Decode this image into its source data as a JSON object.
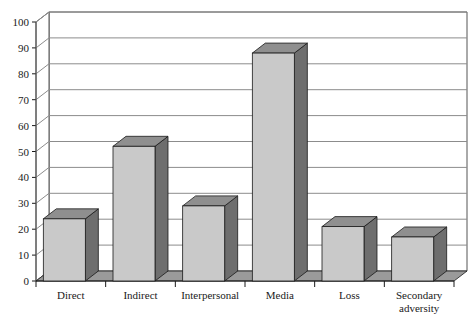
{
  "chart_data": {
    "type": "bar",
    "title": "",
    "subtitle": "",
    "xlabel": "",
    "ylabel": "",
    "categories": [
      "Direct",
      "Indirect",
      "Interpersonal",
      "Media",
      "Loss",
      "Secondary adversity"
    ],
    "values": [
      24,
      52,
      29,
      88,
      21,
      17
    ],
    "series": [
      {
        "name": "Exposure type",
        "values": [
          24,
          52,
          29,
          88,
          21,
          17
        ]
      }
    ],
    "ylim": [
      0,
      100
    ],
    "ytick_labels": [
      "0",
      "10",
      "20",
      "30",
      "40",
      "50",
      "60",
      "70",
      "80",
      "90",
      "100"
    ],
    "ytick_values": [
      0,
      10,
      20,
      30,
      40,
      50,
      60,
      70,
      80,
      90,
      100
    ],
    "grid": true,
    "grid_axis": "y",
    "legend": false,
    "legend_position": "none",
    "style": "3d-column",
    "annotations": []
  },
  "colors": {
    "bar_front": "#c9c9c9",
    "bar_side": "#6e6e6e",
    "bar_top": "#8f8f8f",
    "bar_outline": "#1a1a1a",
    "floor": "#9a9a9a",
    "floor_front": "#767676",
    "plot_background": "#ffffff",
    "grid_line": "#8c8c8c",
    "axis_line": "#555555",
    "text": "#1a1a1a",
    "page_background": "#ffffff"
  },
  "category_labels": [
    {
      "line1": "Direct",
      "line2": ""
    },
    {
      "line1": "Indirect",
      "line2": ""
    },
    {
      "line1": "Interpersonal",
      "line2": ""
    },
    {
      "line1": "Media",
      "line2": ""
    },
    {
      "line1": "Loss",
      "line2": ""
    },
    {
      "line1": "Secondary",
      "line2": "adversity"
    }
  ]
}
